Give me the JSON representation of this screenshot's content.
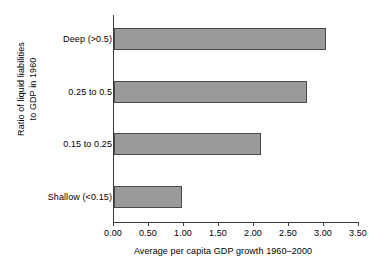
{
  "chart_data": {
    "type": "bar",
    "orientation": "horizontal",
    "title": "",
    "xlabel": "Average per capita GDP growth 1960–2000",
    "ylabel": "Ratio of liquid liabilities to GDP in 1960",
    "ylabel_lines": [
      "Ratio of liquid liabilities",
      "to GDP in 1960"
    ],
    "categories": [
      "Shallow (<0.15)",
      "0.15 to 0.25",
      "0.25 to 0.5",
      "Deep (>0.5)"
    ],
    "values": [
      0.97,
      2.1,
      2.75,
      3.03
    ],
    "xlim": [
      0.0,
      3.5
    ],
    "xticks": [
      0.0,
      0.5,
      1.0,
      1.5,
      2.0,
      2.5,
      3.0,
      3.5
    ],
    "xtick_labels": [
      "0.00",
      "0.50",
      "1.00",
      "1.50",
      "2.00",
      "2.50",
      "3.00",
      "3.50"
    ],
    "grid": false,
    "legend": null,
    "bar_fill_color": "#9a9a9a",
    "bar_edge_color": "#4a4a4a",
    "axis_color": "#3a3a3a"
  }
}
